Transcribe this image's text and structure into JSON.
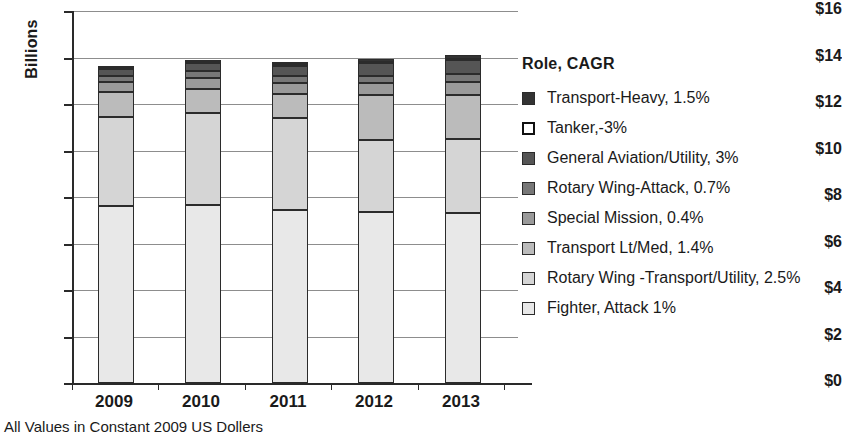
{
  "chart_data": {
    "type": "bar",
    "stacked": true,
    "title": "",
    "subtitle": "",
    "xlabel": "",
    "ylabel": "Billions",
    "footnote": "All Values in Constant 2009 US Dollers",
    "legend_title": "Role, CAGR",
    "legend_position": "right",
    "grid": true,
    "ylim": [
      0,
      16
    ],
    "ytick_step": 2,
    "ytick_labels": [
      "$16",
      "$14",
      "$12",
      "$10",
      "$8",
      "$6",
      "$4",
      "$2",
      "$0"
    ],
    "ytick_values": [
      16,
      14,
      12,
      10,
      8,
      6,
      4,
      2,
      0
    ],
    "categories": [
      "2009",
      "2010",
      "2011",
      "2012",
      "2013"
    ],
    "series": [
      {
        "name": "Fighter, Attack 1%",
        "label": "Fighter, Attack 1%",
        "color": "#e8e8e8",
        "values": [
          7.6,
          7.65,
          7.45,
          7.35,
          7.3
        ]
      },
      {
        "name": "Rotary Wing -Transport/Utility, 2.5%",
        "label": "Rotary Wing -Transport/Utility, 2.5%",
        "color": "#d5d5d5",
        "values": [
          3.85,
          3.95,
          3.95,
          3.1,
          3.2
        ]
      },
      {
        "name": "Transport Lt/Med, 1.4%",
        "label": "Transport Lt/Med, 1.4%",
        "color": "#bbbbbb",
        "values": [
          1.05,
          1.05,
          1.05,
          1.95,
          1.9
        ]
      },
      {
        "name": "Special Mission, 0.4%",
        "label": "Special Mission, 0.4%",
        "color": "#9a9a9a",
        "values": [
          0.45,
          0.45,
          0.45,
          0.5,
          0.55
        ]
      },
      {
        "name": "Rotary Wing-Attack, 0.7%",
        "label": "Rotary Wing-Attack, 0.7%",
        "color": "#777777",
        "values": [
          0.25,
          0.3,
          0.3,
          0.3,
          0.35
        ]
      },
      {
        "name": "General Aviation/Utility, 3%",
        "label": "General Aviation/Utility, 3%",
        "color": "#555555",
        "values": [
          0.3,
          0.35,
          0.45,
          0.55,
          0.6
        ]
      },
      {
        "name": "Tanker,-3%",
        "label": "Tanker,-3%",
        "color": "#ffffff",
        "values": [
          0.05,
          0.05,
          0.05,
          0.05,
          0.05
        ]
      },
      {
        "name": "Transport-Heavy, 1.5%",
        "label": "Transport-Heavy, 1.5%",
        "color": "#333333",
        "values": [
          0.05,
          0.05,
          0.1,
          0.15,
          0.15
        ]
      }
    ],
    "totals": [
      13.6,
      13.85,
      13.8,
      13.95,
      14.1
    ]
  },
  "legend": {
    "title": "Role, CAGR",
    "items": [
      {
        "label": "Transport-Heavy, 1.5%",
        "color": "#333333",
        "hollow": false
      },
      {
        "label": "Tanker,-3%",
        "color": "#ffffff",
        "hollow": true
      },
      {
        "label": "General Aviation/Utility, 3%",
        "color": "#555555",
        "hollow": false
      },
      {
        "label": "Rotary Wing-Attack, 0.7%",
        "color": "#777777",
        "hollow": false
      },
      {
        "label": "Special Mission, 0.4%",
        "color": "#9a9a9a",
        "hollow": false
      },
      {
        "label": "Transport Lt/Med, 1.4%",
        "color": "#bbbbbb",
        "hollow": false
      },
      {
        "label": "Rotary Wing -Transport/Utility, 2.5%",
        "color": "#d5d5d5",
        "hollow": false
      },
      {
        "label": "Fighter, Attack 1%",
        "color": "#e8e8e8",
        "hollow": false
      }
    ]
  },
  "axis": {
    "y_title": "Billions",
    "y_ticks": [
      "$16",
      "$14",
      "$12",
      "$10",
      "$8",
      "$6",
      "$4",
      "$2",
      "$0"
    ],
    "x_ticks": [
      "2009",
      "2010",
      "2011",
      "2012",
      "2013"
    ]
  },
  "footnote": "All Values in Constant 2009 US Dollers"
}
